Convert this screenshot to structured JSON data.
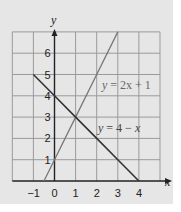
{
  "chart_data": {
    "type": "line",
    "title": "",
    "xlabel": "x",
    "ylabel": "y",
    "xlim": [
      -2,
      5
    ],
    "ylim": [
      0,
      7
    ],
    "grid": true,
    "x_ticks": [
      "-1",
      "0",
      "1",
      "2",
      "3",
      "4"
    ],
    "y_ticks": [
      "1",
      "2",
      "3",
      "4",
      "5",
      "6"
    ],
    "series": [
      {
        "name": "y = 2x + 1",
        "label": "y = 2x + 1",
        "color": "#777777",
        "x": [
          -0.5,
          0,
          1,
          2,
          3
        ],
        "y": [
          0,
          1,
          3,
          5,
          7
        ]
      },
      {
        "name": "y = 4 − x",
        "label": "y = 4 − x",
        "color": "#333333",
        "x": [
          -1,
          0,
          1,
          2,
          3,
          4
        ],
        "y": [
          5,
          4,
          3,
          2,
          1,
          0
        ]
      }
    ],
    "annotations": [
      {
        "text": "y = 2x + 1",
        "at": [
          3.3,
          4.6
        ]
      },
      {
        "text": "y = 4 − x",
        "at": [
          3.0,
          2.6
        ]
      }
    ],
    "intersection": [
      1,
      3
    ]
  },
  "labels": {
    "x_axis": "x",
    "y_axis": "y",
    "eq1_lhs": "y",
    "eq1_rhs": " = 2x + 1",
    "eq2_lhs": "y",
    "eq2_rhs": " = 4 − ",
    "eq2_var": "x"
  },
  "colors": {
    "panel": "#e6e6e6",
    "grid": "#9a9a9a",
    "axis": "#222222",
    "line_2x_plus_1": "#777777",
    "line_4_minus_x": "#333333"
  }
}
